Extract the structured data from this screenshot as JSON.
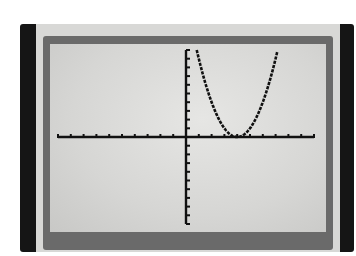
{
  "device": {
    "type": "graphing-calculator-screen"
  },
  "chart_data": {
    "type": "line",
    "title": "",
    "function": "y = (x - 4)^2",
    "xlabel": "",
    "ylabel": "",
    "xlim": [
      -10,
      10
    ],
    "ylim": [
      -10,
      10
    ],
    "xscl": 1,
    "yscl": 1,
    "grid": false,
    "legend": null,
    "series": [
      {
        "name": "Y1",
        "x": [
          0.84,
          1,
          2,
          3,
          3.5,
          4,
          4.5,
          5,
          6,
          7,
          7.16
        ],
        "y": [
          10,
          9,
          4,
          1,
          0.25,
          0,
          0.25,
          1,
          4,
          9,
          10
        ]
      }
    ],
    "vertex": [
      4,
      0
    ]
  },
  "colors": {
    "lcd": "#dcdcda",
    "ink": "#111111",
    "frame": "#6a6a6a",
    "bezel": "#d8d8d6",
    "side_bars": "#151515"
  }
}
